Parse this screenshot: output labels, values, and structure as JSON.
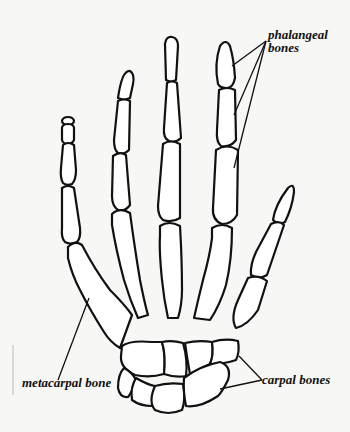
{
  "diagram": {
    "labels": {
      "phalangeal": [
        "phalangeal",
        "bones"
      ],
      "metacarpal": "metacarpal bone",
      "carpal": "carpal bones"
    },
    "colors": {
      "background": "#f7f7f5",
      "bone_fill": "#ffffff",
      "outline": "#111111"
    }
  }
}
